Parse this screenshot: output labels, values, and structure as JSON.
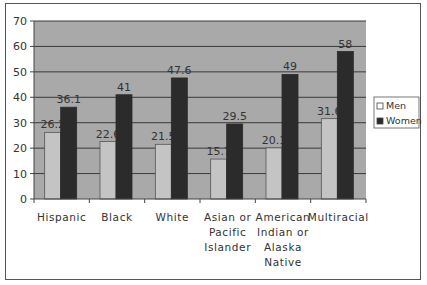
{
  "chart_data": {
    "type": "bar",
    "title": "",
    "xlabel": "",
    "ylabel": "",
    "ylim": [
      0,
      70
    ],
    "yticks": [
      0,
      10,
      20,
      30,
      40,
      50,
      60,
      70
    ],
    "grid": true,
    "legend_position": "right",
    "categories": [
      [
        "Hispanic"
      ],
      [
        "Black"
      ],
      [
        "White"
      ],
      [
        "Asian or",
        "Pacific",
        "Islander"
      ],
      [
        "American",
        "Indian or",
        "Alaska",
        "Native"
      ],
      [
        "Multiracial"
      ]
    ],
    "series": [
      {
        "name": "Men",
        "values": [
          26.2,
          22.6,
          21.5,
          15.7,
          20.1,
          31.6
        ],
        "color": "#c4c4c4"
      },
      {
        "name": "Women",
        "values": [
          36.1,
          41,
          47.6,
          29.5,
          49,
          58
        ],
        "color": "#2b2b2b"
      }
    ]
  },
  "colors": {
    "plot_background": "#a9a9a9",
    "gridline": "#3a3a3a",
    "axis": "#444444",
    "frame": "#555555"
  }
}
